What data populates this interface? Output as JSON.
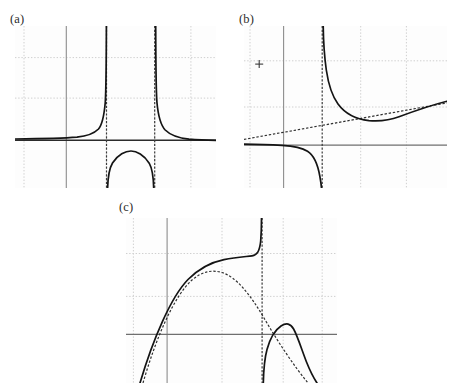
{
  "figure": {
    "background_color": "#ffffff",
    "panel_background_color": "#fdfdfd",
    "curve_color": "#1a1a1a",
    "axis_color": "#7a7a7a",
    "grid_color": "#d9d9d9",
    "dotted_grid_color": "#cfcfcf",
    "asymptote_color": "#2b2b2b",
    "panels": [
      {
        "label": "(a)",
        "label_x": 10,
        "label_y": 12,
        "frame": {
          "x": 15,
          "y": 26,
          "w": 201,
          "h": 162
        },
        "type": "line",
        "description": "Rational function with two vertical asymptotes and a horizontal asymptote at y=0",
        "axes": {
          "x_axis_y_frac": 0.705,
          "y_axis_x_frac": 0.255
        },
        "grid": {
          "vertical_solid_frac": [
            0.255
          ],
          "vertical_dotted_frac": [
            0.045,
            0.455,
            0.695,
            0.875
          ],
          "horizontal_solid_frac": [
            0.705
          ],
          "horizontal_dotted_frac": [
            0.195,
            0.445
          ]
        },
        "vertical_asymptotes_frac": [
          0.455,
          0.695
        ],
        "horizontal_asymptote_frac": 0.705,
        "branches": [
          "left branch rising to +infinity at first asymptote",
          "middle branch a downward bump below the x-axis",
          "right branch falling from +infinity toward y=0"
        ]
      },
      {
        "label": "(b)",
        "label_x": 239,
        "label_y": 12,
        "frame": {
          "x": 244,
          "y": 26,
          "w": 203,
          "h": 162
        },
        "type": "line",
        "description": "Rational function with one vertical asymptote and an oblique (slant) asymptote",
        "axes": {
          "x_axis_y_frac": 0.735,
          "y_axis_x_frac": 0.195
        },
        "grid": {
          "vertical_solid_frac": [
            0.195
          ],
          "vertical_dotted_frac": [
            0.03,
            0.575,
            0.8
          ],
          "horizontal_solid_frac": [
            0.735
          ],
          "horizontal_dotted_frac": [
            0.215,
            0.5
          ]
        },
        "vertical_asymptotes_frac": [
          0.385
        ],
        "slant_asymptote": {
          "x0_frac": 0.0,
          "y0_frac": 0.7,
          "x1_frac": 1.0,
          "y1_frac": 0.475
        },
        "marker": {
          "symbol": "+",
          "x_frac": 0.075,
          "y_frac": 0.235
        },
        "branches": [
          "lower-left branch descending to -infinity at the vertical asymptote",
          "upper-right branch descending from +infinity to a minimum then following the slant asymptote"
        ]
      },
      {
        "label": "(c)",
        "label_x": 119,
        "label_y": 200,
        "frame": {
          "x": 126,
          "y": 218,
          "w": 211,
          "h": 165
        },
        "type": "line",
        "description": "Rational function with a vertical asymptote and a parabolic (curvilinear) asymptote",
        "axes": {
          "x_axis_y_frac": 0.705,
          "y_axis_x_frac": 0.195
        },
        "grid": {
          "vertical_solid_frac": [
            0.195
          ],
          "vertical_dotted_frac": [
            0.035,
            0.455,
            0.745,
            0.93
          ],
          "horizontal_solid_frac": [
            0.705
          ],
          "horizontal_dotted_frac": [
            0.215,
            0.475
          ]
        },
        "vertical_asymptotes_frac": [
          0.645
        ],
        "parabolic_asymptote": "downward parabola peaking near x=0.42",
        "branches": [
          "left branch following the parabola then rising steeply to +infinity at the asymptote",
          "right branch rising from -infinity to a local maximum then falling along the parabola"
        ]
      }
    ]
  }
}
